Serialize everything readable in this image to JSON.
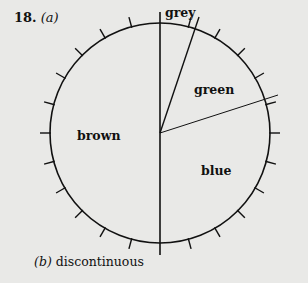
{
  "question": {
    "number": "18.",
    "part_a": "(a)"
  },
  "diagram": {
    "type": "pie-with-ticks",
    "tick_interval_degrees": 15,
    "sectors": [
      {
        "label": "grey",
        "start_deg": 0,
        "end_deg": 20
      },
      {
        "label": "green",
        "start_deg": 20,
        "end_deg": 69
      },
      {
        "label": "blue",
        "start_deg": 69,
        "end_deg": 180
      },
      {
        "label": "brown",
        "start_deg": 180,
        "end_deg": 360
      }
    ]
  },
  "labels": {
    "grey": "grey",
    "green": "green",
    "blue": "blue",
    "brown": "brown"
  },
  "part_b": {
    "marker": "(b)",
    "answer": "discontinuous"
  }
}
